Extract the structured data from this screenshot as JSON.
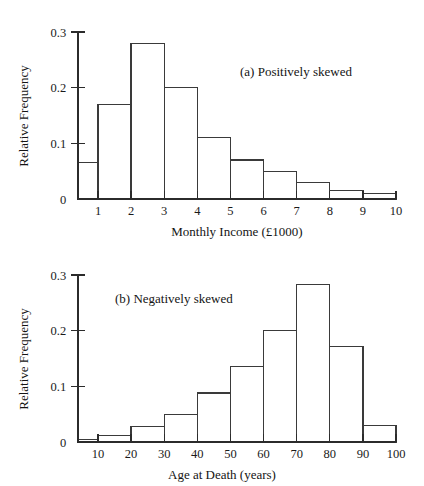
{
  "figure": {
    "background": "#ffffff",
    "line_color": "#3a3a3a",
    "text_color": "#141414"
  },
  "chart_data": [
    {
      "type": "bar",
      "id": "positively-skewed",
      "title": "(a) Positively skewed",
      "xlabel": "Monthly Income (£1000)",
      "ylabel": "Relative Frequency",
      "xlim": [
        0.4,
        10
      ],
      "ylim": [
        0,
        0.3
      ],
      "grid": false,
      "legend": null,
      "xticks": [
        1,
        2,
        3,
        4,
        5,
        6,
        7,
        8,
        9,
        10
      ],
      "xticklabels": [
        "1",
        "2",
        "3",
        "4",
        "5",
        "6",
        "7",
        "8",
        "9",
        "10"
      ],
      "yticks": [
        0,
        0.1,
        0.2,
        0.3
      ],
      "yticklabels": [
        "0",
        "0.1",
        "0.2",
        "0.3"
      ],
      "bin_edges": [
        0.4,
        1,
        2,
        3,
        4,
        5,
        6,
        7,
        8,
        9,
        10
      ],
      "categories": [
        "0.4-1",
        "1-2",
        "2-3",
        "3-4",
        "4-5",
        "5-6",
        "6-7",
        "7-8",
        "8-9",
        "9-10"
      ],
      "values": [
        0.065,
        0.17,
        0.28,
        0.2,
        0.11,
        0.07,
        0.05,
        0.03,
        0.015,
        0.01
      ]
    },
    {
      "type": "bar",
      "id": "negatively-skewed",
      "title": "(b) Negatively skewed",
      "xlabel": "Age at Death (years)",
      "ylabel": "Relative Frequency",
      "xlim": [
        4,
        100
      ],
      "ylim": [
        0,
        0.3
      ],
      "grid": false,
      "legend": null,
      "xticks": [
        10,
        20,
        30,
        40,
        50,
        60,
        70,
        80,
        90,
        100
      ],
      "xticklabels": [
        "10",
        "20",
        "30",
        "40",
        "50",
        "60",
        "70",
        "80",
        "90",
        "100"
      ],
      "yticks": [
        0,
        0.1,
        0.2,
        0.3
      ],
      "yticklabels": [
        "0",
        "0.1",
        "0.2",
        "0.3"
      ],
      "bin_edges": [
        4,
        10,
        20,
        30,
        40,
        50,
        60,
        70,
        80,
        90,
        100
      ],
      "categories": [
        "4-10",
        "10-20",
        "20-30",
        "30-40",
        "40-50",
        "50-60",
        "60-70",
        "70-80",
        "80-90",
        "90-100"
      ],
      "values": [
        0.005,
        0.012,
        0.028,
        0.05,
        0.088,
        0.135,
        0.2,
        0.283,
        0.172,
        0.03
      ]
    }
  ]
}
